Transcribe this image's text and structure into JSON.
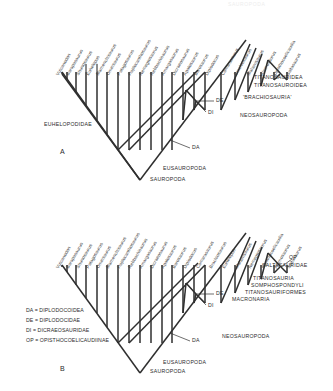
{
  "figure": {
    "header_faint": "SAUROPODA",
    "panels": [
      {
        "letter": "A",
        "taxa": [
          "Vulcanodon",
          "Barapasaurus",
          "Shunosaurus",
          "Euhelopus",
          "Mamenchisaurus",
          "Omeisaurus",
          "Patagosaurus",
          "Haplocanthosaurus",
          "Nemegtosaurus",
          "Rebbachisaurus",
          "Amargasaurus",
          "Dicraeosaurus",
          "Apatosaurus",
          "Barosaurus",
          "Diplodocus",
          "Camarasaurus",
          "Brachiosaurus",
          "Malawisaurus",
          "Alamosaurus",
          "Opisthocoelicaudia",
          "Saltasaurus"
        ],
        "node_abbrevs": [
          "DE",
          "DI",
          "DA"
        ],
        "clades": [
          "EUHELOPODIDAE",
          "TITANOSAURIDEA",
          "TITANOSAUROIDEA",
          "'BRACHIOSAURIA'",
          "NEOSAUROPODA",
          "EUSAUROPODA",
          "SAUROPODA"
        ]
      },
      {
        "letter": "B",
        "taxa": [
          "Vulcanodon",
          "Barapasaurus",
          "Shunosaurus",
          "Patagosaurus",
          "Omeisaurus",
          "Mamenchisaurus",
          "Haplocanthosaurus",
          "Rebbachisaurus",
          "Amargasaurus",
          "Dicraeosaurus",
          "Apatosaurus",
          "Barosaurus",
          "Diplodocus",
          "Camarasaurus",
          "Brachiosaurus",
          "Euhelopus",
          "Malawisaurus",
          "Nemegtosaurus",
          "Opisthocoelicaudia",
          "Alamosaurus",
          "Saltasaurus"
        ],
        "node_abbrevs": [
          "DE",
          "DI",
          "DA",
          "OP"
        ],
        "clades": [
          "SALTASAURIDAE",
          "TITANOSAURIA",
          "SOMPHOSPONDYLI",
          "TITANOSAURIFORMES",
          "MACRONARIA",
          "NEOSAUROPODA",
          "EUSAUROPODA",
          "SAUROPODA"
        ],
        "key": [
          "DA = DIPLODOCOIDEA",
          "DE = DIPLODOCIDAE",
          "DI = DICRAEOSAURIDAE",
          "OP = OPISTHOCOELICAUDIINAE"
        ]
      }
    ]
  },
  "colors": {
    "line": "#2f2f2f",
    "text": "#2b2b2b",
    "background": "#ffffff"
  }
}
